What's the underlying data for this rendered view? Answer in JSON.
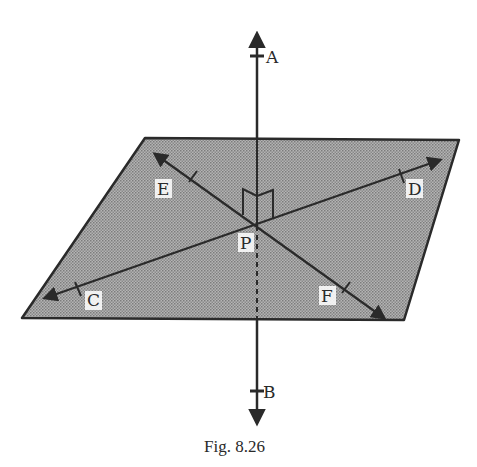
{
  "figure": {
    "caption": "Fig. 8.26",
    "colors": {
      "plane_fill": "#9a9a9a",
      "stroke": "#2a2a2a",
      "background": "#ffffff"
    },
    "plane": {
      "vertices": [
        [
          145,
          138
        ],
        [
          459,
          140
        ],
        [
          404,
          320
        ],
        [
          22,
          318
        ]
      ]
    },
    "point_P": {
      "label": "P",
      "x": 257,
      "y": 226
    },
    "lines": [
      {
        "name": "AB",
        "from": [
          257,
          32
        ],
        "to": [
          257,
          425
        ],
        "perpendicular_to_plane": true
      },
      {
        "name": "CD",
        "from": [
          33,
          302
        ],
        "to": [
          441,
          160
        ]
      },
      {
        "name": "EF",
        "from": [
          153,
          157
        ],
        "to": [
          384,
          319
        ]
      }
    ],
    "labels": {
      "A": "A",
      "B": "B",
      "C": "C",
      "D": "D",
      "E": "E",
      "F": "F",
      "P": "P"
    }
  }
}
